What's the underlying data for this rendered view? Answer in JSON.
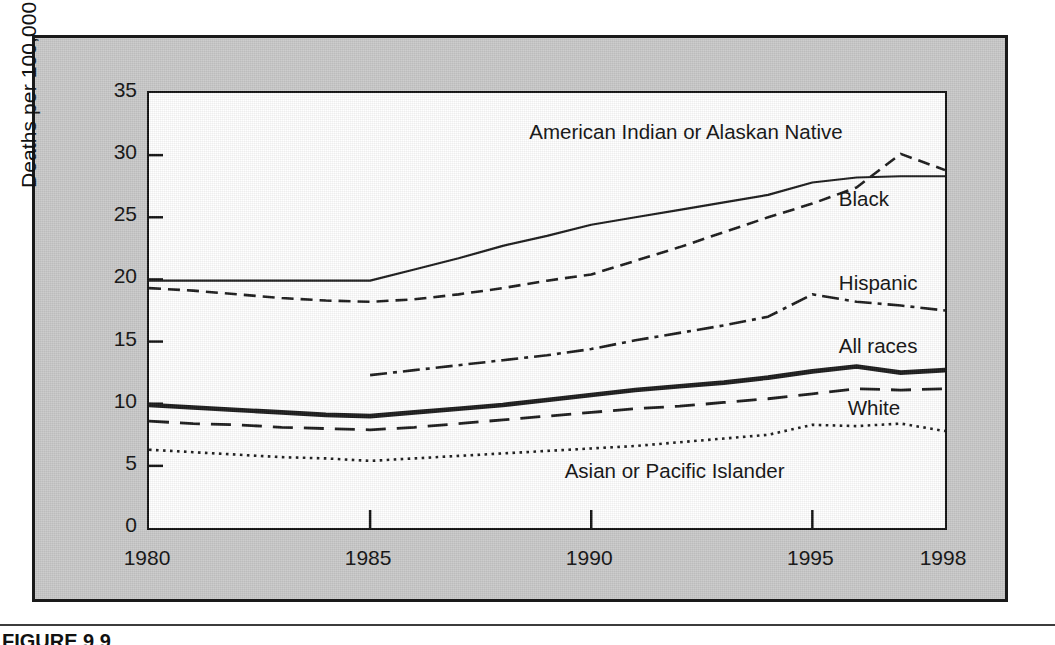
{
  "figure": {
    "caption": "FIGURE 9.9",
    "panel_color": "#c9c9c9",
    "plot_background": "#ffffff",
    "ink_color": "#111111"
  },
  "chart_data": {
    "type": "line",
    "title": "",
    "subtitle": "",
    "xlabel": "",
    "ylabel": "Deaths per 100,000 population",
    "xlim": [
      1980,
      1998
    ],
    "ylim": [
      0,
      35
    ],
    "grid": false,
    "legend_position": "inline-right-annotations",
    "x_ticks": [
      "1980",
      "1985",
      "1990",
      "1995",
      "1998"
    ],
    "x_tick_values": [
      1980,
      1985,
      1990,
      1995,
      1998
    ],
    "y_ticks": [
      "0",
      "5",
      "10",
      "15",
      "20",
      "25",
      "30",
      "35"
    ],
    "y_tick_values": [
      0,
      5,
      10,
      15,
      20,
      25,
      30,
      35
    ],
    "series": [
      {
        "name": "American Indian or Alaskan Native",
        "style": "dashed",
        "label_x": 1988.6,
        "label_y": 31.8,
        "x": [
          1980,
          1981,
          1982,
          1983,
          1984,
          1985,
          1986,
          1987,
          1988,
          1989,
          1990,
          1991,
          1992,
          1993,
          1994,
          1995,
          1996,
          1997,
          1998
        ],
        "values": [
          19.3,
          19.1,
          18.8,
          18.5,
          18.3,
          18.2,
          18.4,
          18.8,
          19.3,
          19.9,
          20.4,
          21.5,
          22.6,
          23.8,
          25.0,
          26.1,
          27.4,
          30.1,
          28.8
        ]
      },
      {
        "name": "Black",
        "style": "solid-thin",
        "label_x": 1995.6,
        "label_y": 26.4,
        "x": [
          1980,
          1981,
          1982,
          1983,
          1984,
          1985,
          1986,
          1987,
          1988,
          1989,
          1990,
          1991,
          1992,
          1993,
          1994,
          1995,
          1996,
          1997,
          1998
        ],
        "values": [
          19.9,
          19.9,
          19.9,
          19.9,
          19.9,
          19.9,
          20.8,
          21.7,
          22.7,
          23.5,
          24.4,
          25.0,
          25.6,
          26.2,
          26.8,
          27.8,
          28.2,
          28.3,
          28.3
        ]
      },
      {
        "name": "Hispanic",
        "style": "dash-dot",
        "label_x": 1995.6,
        "label_y": 19.6,
        "x": [
          1985,
          1986,
          1987,
          1988,
          1989,
          1990,
          1991,
          1992,
          1993,
          1994,
          1995,
          1996,
          1997,
          1998
        ],
        "values": [
          12.3,
          12.7,
          13.1,
          13.5,
          13.9,
          14.4,
          15.1,
          15.7,
          16.3,
          17.0,
          18.8,
          18.2,
          17.9,
          17.5
        ]
      },
      {
        "name": "All races",
        "style": "solid-thick",
        "label_x": 1995.6,
        "label_y": 14.6,
        "x": [
          1980,
          1981,
          1982,
          1983,
          1984,
          1985,
          1986,
          1987,
          1988,
          1989,
          1990,
          1991,
          1992,
          1993,
          1994,
          1995,
          1996,
          1997,
          1998
        ],
        "values": [
          9.9,
          9.7,
          9.5,
          9.3,
          9.1,
          9.0,
          9.3,
          9.6,
          9.9,
          10.3,
          10.7,
          11.1,
          11.4,
          11.7,
          12.1,
          12.6,
          13.0,
          12.5,
          12.7
        ]
      },
      {
        "name": "White",
        "style": "long-dash",
        "label_x": 1995.8,
        "label_y": 9.6,
        "x": [
          1980,
          1981,
          1982,
          1983,
          1984,
          1985,
          1986,
          1987,
          1988,
          1989,
          1990,
          1991,
          1992,
          1993,
          1994,
          1995,
          1996,
          1997,
          1998
        ],
        "values": [
          8.6,
          8.4,
          8.3,
          8.1,
          8.0,
          7.9,
          8.1,
          8.4,
          8.7,
          9.0,
          9.3,
          9.6,
          9.8,
          10.1,
          10.4,
          10.8,
          11.2,
          11.1,
          11.2
        ]
      },
      {
        "name": "Asian or Pacific Islander",
        "style": "dotted",
        "label_x": 1989.4,
        "label_y": 4.5,
        "x": [
          1980,
          1981,
          1982,
          1983,
          1984,
          1985,
          1986,
          1987,
          1988,
          1989,
          1990,
          1991,
          1992,
          1993,
          1994,
          1995,
          1996,
          1997,
          1998
        ],
        "values": [
          6.3,
          6.1,
          5.9,
          5.7,
          5.6,
          5.4,
          5.6,
          5.8,
          6.0,
          6.2,
          6.4,
          6.6,
          6.9,
          7.2,
          7.5,
          8.3,
          8.2,
          8.4,
          7.8
        ]
      }
    ]
  }
}
